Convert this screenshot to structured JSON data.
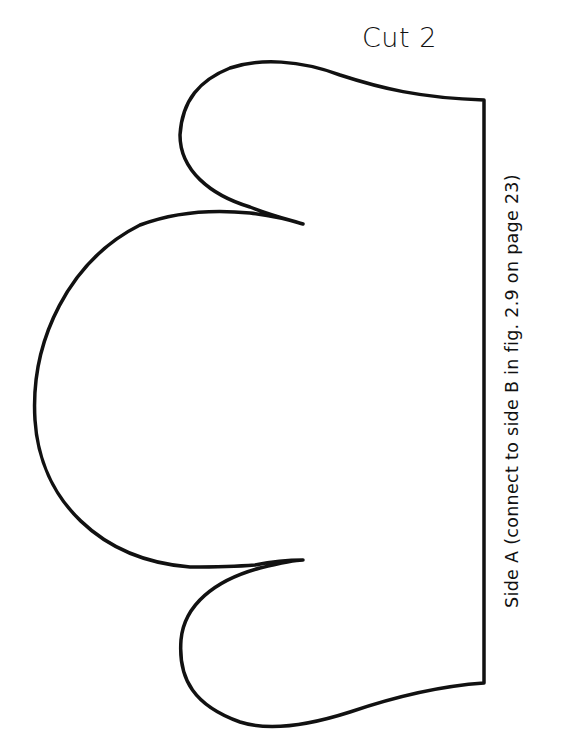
{
  "page": {
    "top_cutoff_text": ""
  },
  "pattern": {
    "cut_label": "Cut 2",
    "side_label": "Side A (connect to side B in fig. 2.9 on page 23)",
    "outline_color": "#111111",
    "background_color": "#ffffff"
  }
}
